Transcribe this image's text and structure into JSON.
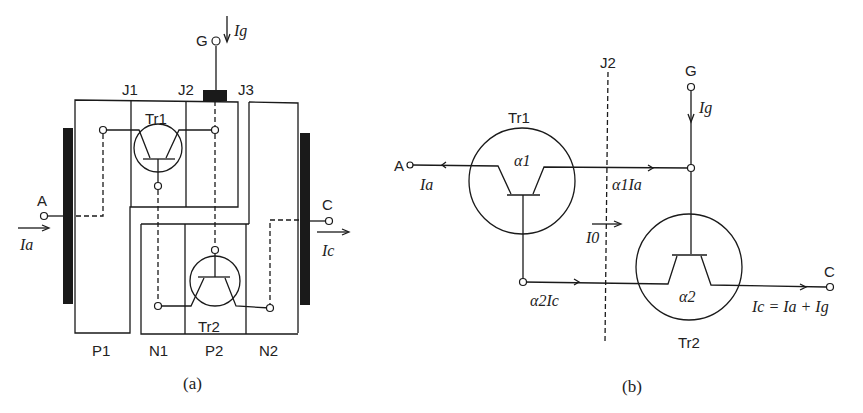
{
  "diagram_a": {
    "caption": "(a)",
    "gate_label": "G",
    "gate_current": "Ig",
    "anode_label": "A",
    "anode_current": "Ia",
    "cathode_label": "C",
    "cathode_current": "Ic",
    "junctions": [
      "J1",
      "J2",
      "J3"
    ],
    "layers": [
      "P1",
      "N1",
      "P2",
      "N2"
    ],
    "transistors": [
      "Tr1",
      "Tr2"
    ]
  },
  "diagram_b": {
    "caption": "(b)",
    "anode_label": "A",
    "anode_current": "Ia",
    "gate_label": "G",
    "gate_current": "Ig",
    "cathode_label": "C",
    "junction_label": "J2",
    "tr1_label": "Tr1",
    "tr1_gain": "α1",
    "tr2_label": "Tr2",
    "tr2_gain": "α2",
    "current_tr1": "α1Ia",
    "current_tr2": "α2Ic",
    "leakage_current": "I0",
    "output_equation": "Ic = Ia + Ig"
  }
}
